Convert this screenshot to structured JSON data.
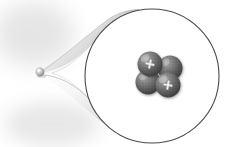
{
  "figure": {
    "title": "Atomic nucleus magnification",
    "background_color": "#ffffff",
    "width": 228,
    "height": 147
  },
  "source_object": {
    "name": "atom-sphere",
    "label": "atom",
    "center_x": 40,
    "center_y": 72,
    "radius": 4.2,
    "color": "#b9b9b9",
    "highlight_color": "#f2f2f2",
    "shadow_color": "#777777"
  },
  "magnifier_cone": {
    "name": "magnification-cone",
    "label": "magnification cone",
    "fill_light": "#ffffff",
    "fill_mid": "#d8d8d8",
    "fill_dark": "#9a9a9a",
    "edge_color": "#8d8d8d",
    "hatch_color": "#c6c6c6"
  },
  "magnified_circle": {
    "name": "magnified-view-circle",
    "label": "magnified view",
    "center_x": 152,
    "center_y": 76,
    "radius": 67,
    "stroke_color": "#4a4a4a",
    "stroke_width": 1.1,
    "fill_color": "#ffffff"
  },
  "backdrop_blobs": [
    {
      "name": "soft-shadow-upper-left",
      "cx": 34,
      "cy": 34,
      "rx": 40,
      "ry": 32,
      "color": "#dddddd"
    },
    {
      "name": "soft-shadow-lower-left",
      "cx": 52,
      "cy": 124,
      "rx": 48,
      "ry": 22,
      "color": "#e2e2e2"
    }
  ],
  "nucleus": {
    "name": "helium-nucleus",
    "label": "nucleus",
    "particle_count": 4,
    "proton_count": 2,
    "neutron_count": 2,
    "charge_symbol": "+",
    "sphere_base_color": "#6f6f6f",
    "sphere_dark_color": "#3a3a3a",
    "sphere_highlight_color": "#c5c5c5",
    "charge_symbol_color": "#ededed",
    "particles": [
      {
        "name": "particle-back-right",
        "type": "neutron",
        "cx": 170,
        "cy": 68,
        "r": 12.5,
        "charge": "",
        "z": 1
      },
      {
        "name": "particle-front-left",
        "type": "neutron",
        "cx": 148,
        "cy": 82,
        "r": 12.5,
        "charge": "",
        "z": 2
      },
      {
        "name": "particle-proton-upper-left",
        "type": "proton",
        "cx": 150,
        "cy": 64,
        "r": 12.5,
        "charge": "+",
        "z": 3
      },
      {
        "name": "particle-proton-lower-right",
        "type": "proton",
        "cx": 168,
        "cy": 85,
        "r": 12.5,
        "charge": "+",
        "z": 4
      }
    ]
  }
}
